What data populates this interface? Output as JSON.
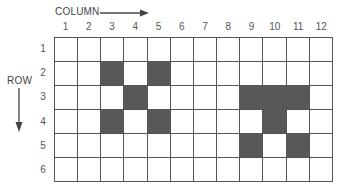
{
  "labels": {
    "column_axis": "COLUMN",
    "row_axis": "ROW"
  },
  "columns": [
    "1",
    "2",
    "3",
    "4",
    "5",
    "6",
    "7",
    "8",
    "9",
    "10",
    "11",
    "12"
  ],
  "rows": [
    "1",
    "2",
    "3",
    "4",
    "5",
    "6"
  ],
  "colors": {
    "filled": "#585858",
    "empty": "#ffffff",
    "grid_line": "#555555"
  },
  "filled_cells": [
    [
      2,
      3
    ],
    [
      2,
      5
    ],
    [
      3,
      4
    ],
    [
      3,
      9
    ],
    [
      3,
      10
    ],
    [
      3,
      11
    ],
    [
      4,
      3
    ],
    [
      4,
      5
    ],
    [
      4,
      10
    ],
    [
      5,
      9
    ],
    [
      5,
      11
    ]
  ]
}
